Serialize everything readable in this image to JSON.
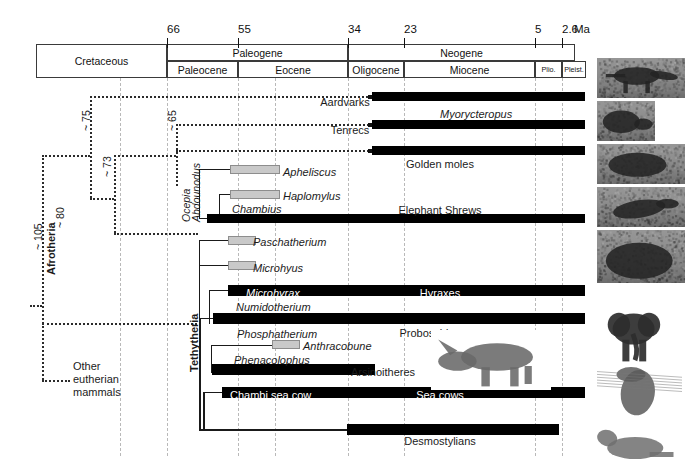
{
  "figure": {
    "type": "phylogenetic-time-tree",
    "units_label": "Ma"
  },
  "timescale": {
    "ticks": [
      {
        "value": "66",
        "x": 167
      },
      {
        "value": "55",
        "x": 238
      },
      {
        "value": "34",
        "x": 348
      },
      {
        "value": "23",
        "x": 404
      },
      {
        "value": "5",
        "x": 535
      },
      {
        "value": "2.6",
        "x": 562
      }
    ],
    "units": "Ma",
    "row1": [
      {
        "label": "Cretaceous",
        "x": 36,
        "w": 131
      },
      {
        "label": "Paleogene",
        "x": 167,
        "w": 181
      },
      {
        "label": "Neogene",
        "x": 348,
        "w": 227
      }
    ],
    "row2": [
      {
        "label": "Paleocene",
        "x": 167,
        "w": 71,
        "small": false
      },
      {
        "label": "Eocene",
        "x": 238,
        "w": 110,
        "small": false
      },
      {
        "label": "Oligocene",
        "x": 348,
        "w": 56,
        "small": false
      },
      {
        "label": "Miocene",
        "x": 404,
        "w": 131,
        "small": false
      },
      {
        "label": "Plio.",
        "x": 535,
        "w": 27,
        "small": true
      },
      {
        "label": "Pleist.",
        "x": 562,
        "w": 24,
        "small": true
      }
    ]
  },
  "gridlines": [
    120,
    167,
    238,
    275,
    348,
    404,
    535,
    562
  ],
  "clades": [
    {
      "name": "Afrotheria",
      "rot": true,
      "bold": true
    },
    {
      "name": "Tethytheria",
      "rot": true,
      "bold": true
    }
  ],
  "node_ages": [
    {
      "label": "~ 105",
      "x": 32,
      "y": 250
    },
    {
      "label": "~ 80",
      "x": 54,
      "y": 228
    },
    {
      "label": "~ 75",
      "x": 80,
      "y": 131
    },
    {
      "label": "~ 73",
      "x": 101,
      "y": 177
    },
    {
      "label": "~ 65",
      "x": 166,
      "y": 131
    }
  ],
  "rotated_taxa": [
    {
      "label": "Ocepia",
      "x": 176,
      "y": 215
    },
    {
      "label": "Abdounodus",
      "x": 186,
      "y": 215
    }
  ],
  "taxa": [
    {
      "id": "aardvarks",
      "label": "Aardvarks",
      "style": "plain",
      "x": 345,
      "y": 102
    },
    {
      "id": "myorycteropus",
      "label": "Myorycteropus",
      "style": "italic",
      "x": 440,
      "y": 114
    },
    {
      "id": "tenrecs",
      "label": "Tenrecs",
      "style": "plain",
      "x": 350,
      "y": 130
    },
    {
      "id": "golden-moles",
      "label": "Golden moles",
      "style": "plain",
      "x": 440,
      "y": 164
    },
    {
      "id": "apheliscus",
      "label": "Apheliscus",
      "style": "italic",
      "x": 283,
      "y": 172
    },
    {
      "id": "haplomylus",
      "label": "Haplomylus",
      "style": "italic",
      "x": 283,
      "y": 196
    },
    {
      "id": "chambius",
      "label": "Chambius",
      "style": "italic",
      "x": 232,
      "y": 209
    },
    {
      "id": "elephant-shrews",
      "label": "Elephant Shrews",
      "style": "plain",
      "x": 440,
      "y": 210
    },
    {
      "id": "paschatherium",
      "label": "Paschatherium",
      "style": "italic",
      "x": 253,
      "y": 242
    },
    {
      "id": "microhyus",
      "label": "Microhyus",
      "style": "italic",
      "x": 253,
      "y": 268
    },
    {
      "id": "microhyrax",
      "label": "Microhyrax",
      "style": "italic-white",
      "x": 246,
      "y": 293
    },
    {
      "id": "hyraxes",
      "label": "Hyraxes",
      "style": "white",
      "x": 440,
      "y": 293
    },
    {
      "id": "numidotherium",
      "label": "Numidotherium",
      "style": "italic",
      "x": 236,
      "y": 307
    },
    {
      "id": "proboscidea",
      "label": "Proboscidea",
      "style": "plain",
      "x": 430,
      "y": 333
    },
    {
      "id": "phosphatherium",
      "label": "Phosphatherium",
      "style": "italic",
      "x": 237,
      "y": 334
    },
    {
      "id": "anthracobune",
      "label": "Anthracobune",
      "style": "italic",
      "x": 303,
      "y": 346
    },
    {
      "id": "phenacolophus",
      "label": "Phenacolophus",
      "style": "italic",
      "x": 234,
      "y": 360
    },
    {
      "id": "arsinoitheres",
      "label": "Arsinoitheres",
      "style": "plain",
      "x": 383,
      "y": 372
    },
    {
      "id": "chambi-sea-cow",
      "label": "Chambi sea cow",
      "style": "white",
      "x": 230,
      "y": 395
    },
    {
      "id": "sea-cows",
      "label": "Sea cows",
      "style": "white",
      "x": 440,
      "y": 395
    },
    {
      "id": "desmostylians",
      "label": "Desmostylians",
      "style": "plain",
      "x": 440,
      "y": 441
    }
  ],
  "outgroup": {
    "lines": [
      "Other",
      "eutherian",
      "mammals"
    ],
    "x": 73,
    "y": 366
  },
  "black_bars": [
    {
      "id": "aardvark-bar",
      "x": 372,
      "y": 92,
      "w": 213,
      "h": 9
    },
    {
      "id": "tenrec-bar",
      "x": 372,
      "y": 120,
      "w": 213,
      "h": 9
    },
    {
      "id": "golden-mole-bar",
      "x": 372,
      "y": 146,
      "w": 213,
      "h": 9
    },
    {
      "id": "elephant-shrew-bar",
      "x": 207,
      "y": 214,
      "w": 378,
      "h": 9
    },
    {
      "id": "hyrax-bar",
      "x": 228,
      "y": 285,
      "w": 357,
      "h": 11
    },
    {
      "id": "proboscidea-bar",
      "x": 213,
      "y": 313,
      "w": 372,
      "h": 11
    },
    {
      "id": "arsinoithere-bar",
      "x": 212,
      "y": 364,
      "w": 163,
      "h": 11
    },
    {
      "id": "sea-cow-bar",
      "x": 222,
      "y": 387,
      "w": 363,
      "h": 11
    },
    {
      "id": "desmostylian-bar",
      "x": 347,
      "y": 424,
      "w": 212,
      "h": 11
    }
  ],
  "gray_bars": [
    {
      "id": "apheliscus-bar",
      "x": 230,
      "y": 165,
      "w": 50,
      "h": 9
    },
    {
      "id": "haplomylus-bar",
      "x": 230,
      "y": 190,
      "w": 50,
      "h": 9
    },
    {
      "id": "paschatherium-bar",
      "x": 228,
      "y": 236,
      "w": 28,
      "h": 9
    },
    {
      "id": "microhyus-bar",
      "x": 228,
      "y": 261,
      "w": 28,
      "h": 9
    },
    {
      "id": "anthracobune-bar",
      "x": 272,
      "y": 340,
      "w": 28,
      "h": 9
    }
  ],
  "photos": [
    {
      "id": "aardvark-photo",
      "alt": "aardvark",
      "x": 597,
      "y": 58,
      "w": 88,
      "h": 40
    },
    {
      "id": "tenrec-photo",
      "alt": "tenrec",
      "x": 597,
      "y": 101,
      "w": 58,
      "h": 40
    },
    {
      "id": "golden-mole-photo",
      "alt": "golden-mole",
      "x": 597,
      "y": 144,
      "w": 88,
      "h": 40
    },
    {
      "id": "elephant-shrew-photo",
      "alt": "elephant-shrew",
      "x": 597,
      "y": 187,
      "w": 88,
      "h": 40
    },
    {
      "id": "hyrax-photo",
      "alt": "hyrax",
      "x": 597,
      "y": 230,
      "w": 88,
      "h": 53
    },
    {
      "id": "elephant-photo",
      "alt": "elephant",
      "x": 600,
      "y": 305,
      "w": 70,
      "h": 60
    },
    {
      "id": "sea-cow-photo",
      "alt": "sea-cow",
      "x": 597,
      "y": 363,
      "w": 85,
      "h": 57
    },
    {
      "id": "desmostylian-photo",
      "alt": "desmostylian",
      "x": 597,
      "y": 417,
      "w": 85,
      "h": 50
    },
    {
      "id": "arsinoitherium-photo",
      "alt": "arsinoitherium",
      "x": 431,
      "y": 330,
      "w": 120,
      "h": 60
    }
  ],
  "colors": {
    "black_bar": "#000000",
    "gray_bar": "#c9c9c9",
    "gridline": "#b9b9b9",
    "branch": "#1a1a1a",
    "dashed_branch": "#2b2b2b"
  }
}
